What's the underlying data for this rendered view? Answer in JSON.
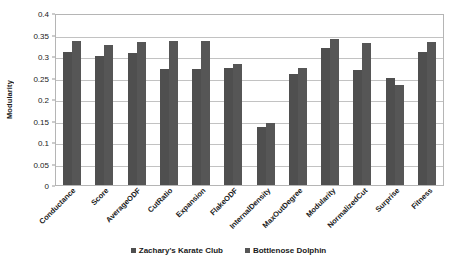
{
  "chart_data": {
    "type": "bar",
    "title": "",
    "xlabel": "",
    "ylabel": "Modularity",
    "ylim": [
      0,
      0.4
    ],
    "yticks": [
      0,
      0.05,
      0.1,
      0.15,
      0.2,
      0.25,
      0.3,
      0.35,
      0.4
    ],
    "ytick_labels": [
      "0",
      "0.05",
      "0.1",
      "0.15",
      "0.2",
      "0.25",
      "0.3",
      "0.35",
      "0.4"
    ],
    "grid": true,
    "legend_position": "bottom",
    "categories": [
      "Conductance",
      "Score",
      "AverageODF",
      "CutRatio",
      "Expansion",
      "FlakeODF",
      "InternalDensity",
      "MaxOutDegree",
      "Modularity",
      "NormalizedCut",
      "Surprise",
      "Fitness"
    ],
    "series": [
      {
        "name": "Zachary's Karate Club",
        "color": "#4f4f4f",
        "values": [
          0.31,
          0.3,
          0.308,
          0.27,
          0.27,
          0.271,
          0.135,
          0.258,
          0.318,
          0.268,
          0.25,
          0.31
        ]
      },
      {
        "name": "Bottlenose Dolphin",
        "color": "#565656",
        "values": [
          0.335,
          0.326,
          0.332,
          0.335,
          0.335,
          0.281,
          0.145,
          0.271,
          0.34,
          0.33,
          0.232,
          0.332
        ]
      }
    ]
  },
  "legend": {
    "items": [
      {
        "label": "Zachary's  Karate Club"
      },
      {
        "label": "Bottlenose Dolphin"
      }
    ]
  }
}
